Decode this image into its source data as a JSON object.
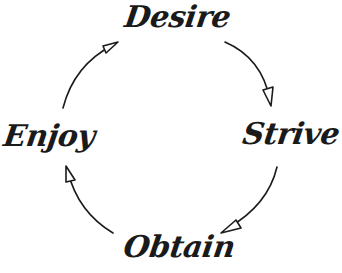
{
  "diagram": {
    "type": "cycle",
    "direction": "clockwise",
    "stroke_color": "#1a1a1a",
    "nodes": [
      {
        "id": "desire",
        "label": "Desire",
        "position": "top"
      },
      {
        "id": "strive",
        "label": "Strive",
        "position": "right"
      },
      {
        "id": "obtain",
        "label": "Obtain",
        "position": "bottom"
      },
      {
        "id": "enjoy",
        "label": "Enjoy",
        "position": "left"
      }
    ],
    "edges": [
      {
        "from": "desire",
        "to": "strive"
      },
      {
        "from": "strive",
        "to": "obtain"
      },
      {
        "from": "obtain",
        "to": "enjoy"
      },
      {
        "from": "enjoy",
        "to": "desire"
      }
    ]
  }
}
